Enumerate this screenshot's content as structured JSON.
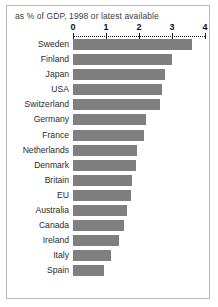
{
  "figure": {
    "caption": "as % of GDP, 1998 or latest available",
    "bar_color": "#7f7f7f",
    "border_color": "#b9b9b9",
    "background": "#ffffff"
  },
  "chart_data": {
    "type": "bar",
    "orientation": "horizontal",
    "title": "as % of GDP, 1998 or latest available",
    "subtitle": "",
    "xlabel": "",
    "ylabel": "",
    "xlim": [
      0,
      4
    ],
    "ticks": [
      0,
      1,
      2,
      3,
      4
    ],
    "tick_labels": [
      "0",
      "1",
      "2",
      "3",
      "4"
    ],
    "grid": false,
    "axis_position": "top",
    "legend": false,
    "categories": [
      "Sweden",
      "Finland",
      "Japan",
      "USA",
      "Switzerland",
      "Germany",
      "France",
      "Netherlands",
      "Denmark",
      "Britain",
      "EU",
      "Australia",
      "Canada",
      "Ireland",
      "Italy",
      "Spain"
    ],
    "values": [
      3.6,
      3.0,
      2.8,
      2.7,
      2.65,
      2.2,
      2.15,
      1.95,
      1.9,
      1.8,
      1.75,
      1.65,
      1.55,
      1.4,
      1.15,
      0.95
    ]
  }
}
